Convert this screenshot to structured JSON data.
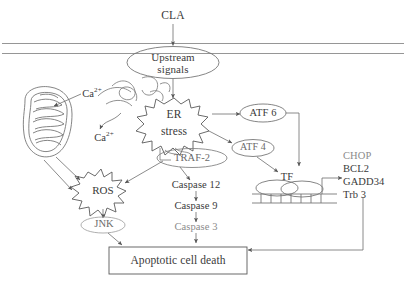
{
  "diagram": {
    "type": "biological-signaling-pathway",
    "stroke_color": "#555555",
    "text_color": "#3a3a3a",
    "background": "#ffffff"
  },
  "nodes": {
    "stimulus": "CLA",
    "upstream": "Upstream\nsignals",
    "upstream_line1": "Upstream",
    "upstream_line2": "signals",
    "er_stress_line1": "ER",
    "er_stress_line2": "stress",
    "traf2": "TRAF-2",
    "atf6": "ATF 6",
    "atf4": "ATF 4",
    "tf": "TF",
    "ros": "ROS",
    "jnk": "JNK",
    "calcium_mito": "Ca",
    "calcium_mito_sup": "2+",
    "calcium_cyto": "Ca",
    "calcium_cyto_sup": "2+",
    "apoptosis": "Apoptotic cell death"
  },
  "caspase_cascade": [
    "Caspase 12",
    "Caspase 9",
    "Caspase 3"
  ],
  "target_genes": [
    "CHOP",
    "BCL2",
    "GADD34",
    "Trb 3"
  ],
  "structures": {
    "membrane": "plasma-membrane-bilayer",
    "mitochondrion": "mitochondrion",
    "er": "endoplasmic-reticulum-tubules",
    "dna": "dna-promoter-ladder"
  }
}
